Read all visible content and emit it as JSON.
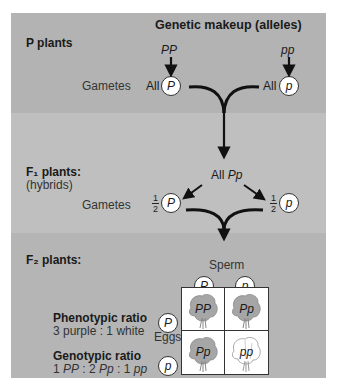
{
  "header": {
    "title": "Genetic makeup (alleles)"
  },
  "p_generation": {
    "label": "P plants",
    "parents": [
      {
        "genotype": "PP",
        "gamete_prefix": "All",
        "gamete": "P"
      },
      {
        "genotype": "pp",
        "gamete_prefix": "All",
        "gamete": "p"
      }
    ],
    "gametes_label": "Gametes"
  },
  "f1_generation": {
    "label": "F₁ plants:",
    "sublabel": "(hybrids)",
    "result_prefix": "All",
    "result_genotype": "Pp",
    "gametes_label": "Gametes",
    "gametes": [
      {
        "fraction_num": "1",
        "fraction_den": "2",
        "allele": "P"
      },
      {
        "fraction_num": "1",
        "fraction_den": "2",
        "allele": "p"
      }
    ]
  },
  "f2_generation": {
    "label": "F₂ plants:",
    "sperm_label": "Sperm",
    "eggs_label": "Eggs",
    "sperm": [
      "P",
      "p"
    ],
    "eggs": [
      "P",
      "p"
    ],
    "punnett": [
      {
        "genotype": "PP",
        "flower": "purple"
      },
      {
        "genotype": "Pp",
        "flower": "purple"
      },
      {
        "genotype": "Pp",
        "flower": "purple"
      },
      {
        "genotype": "pp",
        "flower": "white"
      }
    ],
    "phenotypic_ratio": {
      "title": "Phenotypic ratio",
      "value": "3 purple : 1 white"
    },
    "genotypic_ratio": {
      "title": "Genotypic ratio",
      "parts": [
        "1 ",
        "PP",
        " : 2 ",
        "Pp",
        " : 1 ",
        "pp"
      ]
    }
  },
  "colors": {
    "p_section": "#b3b3b3",
    "f1_section": "#bfbfbf",
    "f2_section": "#b5b5b5",
    "purple_flower": "#a6a6a6",
    "white_flower": "#ffffff",
    "arrow": "#111111"
  }
}
